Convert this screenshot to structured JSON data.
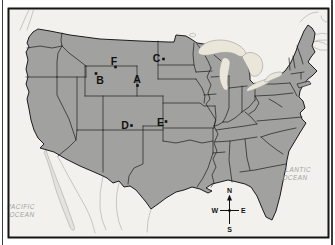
{
  "figure": {
    "points": {
      "A": {
        "label": "A",
        "dot_x": 137.5,
        "dot_y": 85.5
      },
      "B": {
        "label": "B",
        "dot_x": 96,
        "dot_y": 73.5
      },
      "C": {
        "label": "C",
        "dot_x": 163.5,
        "dot_y": 59
      },
      "D": {
        "label": "D",
        "dot_x": 131.5,
        "dot_y": 125.5
      },
      "E": {
        "label": "E",
        "dot_x": 166,
        "dot_y": 121.5
      },
      "F": {
        "label": "F",
        "dot_x": 115.5,
        "dot_y": 67
      }
    },
    "oceans": {
      "pacific": {
        "line1": "PACIFIC",
        "line2": "OCEAN"
      },
      "atlantic": {
        "line1": "ATLANTIC",
        "line2": "OCEAN"
      }
    },
    "compass": {
      "north": "N",
      "south": "S",
      "east": "E",
      "west": "W"
    },
    "colors": {
      "land": "#a1a19f",
      "water": "#f2f1ed",
      "lakes": "#eae7da",
      "border": "#1c1c1c",
      "neighbor_line": "#b3b2ae",
      "baja_fill": "#e3e2dd",
      "ocean_text": "#a3a29e"
    }
  }
}
